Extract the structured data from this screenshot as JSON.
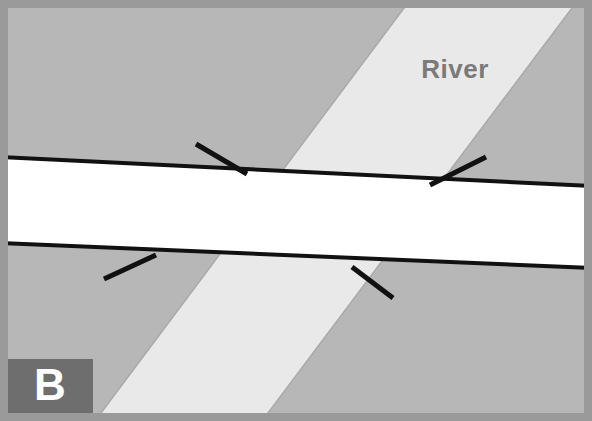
{
  "figure": {
    "panel_id": "B",
    "caption_label": "B",
    "width": 592,
    "height": 421
  },
  "labels": {
    "river": "River",
    "panel": "B"
  },
  "colors": {
    "border": "#9a9a9a",
    "land": "#b7b7b7",
    "river": "#e9e9e9",
    "road": "#ffffff",
    "road_edge": "#111111",
    "abutment_mark": "#111111",
    "panel_box": "#6e6e6e",
    "panel_text": "#ffffff",
    "river_text": "#7a7a7a",
    "canvas": "#ffffff"
  },
  "geometry": {
    "border_width": 8,
    "river_band": {
      "top_left_x": 410,
      "top_right_x": 578,
      "bottom_left_x": 95,
      "bottom_right_x": 262
    },
    "road_band": {
      "left_top_y": 157,
      "left_bottom_y": 243,
      "right_top_y": 186,
      "right_bottom_y": 268
    },
    "abutment_marks": [
      {
        "name": "upper-left-abutment",
        "x1": 196,
        "y1": 144,
        "x2": 247,
        "y2": 174
      },
      {
        "name": "upper-right-abutment",
        "x1": 430,
        "y1": 185,
        "x2": 486,
        "y2": 157
      },
      {
        "name": "lower-left-abutment",
        "x1": 104,
        "y1": 279,
        "x2": 156,
        "y2": 255
      },
      {
        "name": "lower-right-abutment",
        "x1": 352,
        "y1": 267,
        "x2": 393,
        "y2": 298
      }
    ],
    "panel_box": {
      "x": 8,
      "y": 359,
      "width": 85,
      "height": 54
    },
    "river_label_pos": {
      "x": 455,
      "y": 78
    },
    "panel_label_pos": {
      "x": 35,
      "y": 398
    }
  }
}
